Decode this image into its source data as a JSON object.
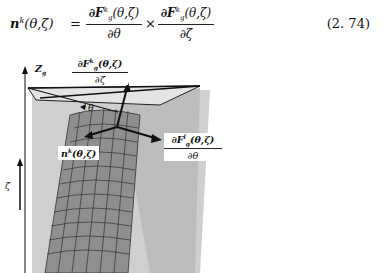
{
  "equation": {
    "lhs": "n",
    "lhs_sup": "k",
    "lhs_args": "(θ,ζ)",
    "equals": "=",
    "term1": {
      "numerator": "∂F",
      "num_sub": "g",
      "num_sup": "k",
      "num_args": "(θ,ζ)",
      "denominator": "∂θ"
    },
    "times": "×",
    "term2": {
      "numerator": "∂F",
      "num_sub": "g",
      "num_sup": "k",
      "num_args": "(θ,ζ)",
      "denominator": "∂ζ"
    },
    "number": "(2. 74)"
  },
  "figure": {
    "axis_z_label": "Z",
    "axis_z_sub": "g",
    "axis_zeta_label": "ζ",
    "theta_label": "θ",
    "label_dF_dzeta": {
      "numerator": "∂F",
      "sub": "g",
      "sup": "k",
      "args": "(θ,ζ)",
      "denominator": "∂ζ"
    },
    "label_dF_dtheta": {
      "numerator": "∂F",
      "sub": "g",
      "sup": "l",
      "args": "(θ,ζ)",
      "denominator": "∂θ"
    },
    "label_normal": {
      "text": "n",
      "sup": "k",
      "args": "(θ,ζ)"
    }
  }
}
